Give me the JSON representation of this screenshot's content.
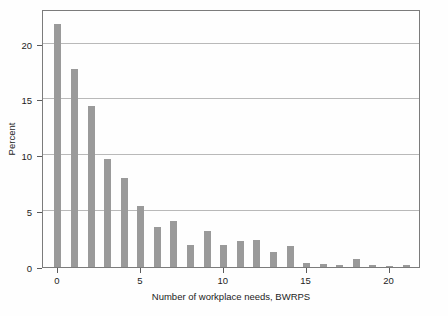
{
  "chart_data": {
    "type": "bar",
    "title": "",
    "subtitle": "",
    "xlabel": "Number of workplace needs, BWRPS",
    "ylabel": "Percent",
    "categories": [
      0,
      1,
      2,
      3,
      4,
      5,
      6,
      7,
      8,
      9,
      10,
      11,
      12,
      13,
      14,
      15,
      16,
      17,
      18,
      19,
      20,
      21
    ],
    "values": [
      21.8,
      17.7,
      14.4,
      9.7,
      8.0,
      5.5,
      3.6,
      4.1,
      2.0,
      3.2,
      2.0,
      2.3,
      2.4,
      1.3,
      1.9,
      0.4,
      0.25,
      0.15,
      0.7,
      0.2,
      0.1,
      0.2
    ],
    "series": [
      {
        "name": "Percent",
        "values": [
          21.8,
          17.7,
          14.4,
          9.7,
          8.0,
          5.5,
          3.6,
          4.1,
          2.0,
          3.2,
          2.0,
          2.3,
          2.4,
          1.3,
          1.9,
          0.4,
          0.25,
          0.15,
          0.7,
          0.2,
          0.1,
          0.2
        ]
      }
    ],
    "xlim": [
      -0.9,
      21.9
    ],
    "ylim": [
      0,
      23.1
    ],
    "xticks": [
      0,
      5,
      10,
      15,
      20
    ],
    "yticks": [
      0,
      5,
      10,
      15,
      20
    ],
    "xtick_labels": [
      "0",
      "5",
      "10",
      "15",
      "20"
    ],
    "ytick_labels": [
      "0",
      "5",
      "10",
      "15",
      "20"
    ],
    "grid": "horizontal",
    "legend": "none",
    "bar_color": "#9a9a9a",
    "gridline_color": "#b9b9b9",
    "axis_color": "#7b7b7b",
    "background_color": "#ffffff"
  }
}
